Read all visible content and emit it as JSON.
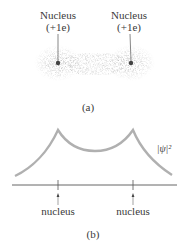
{
  "panel_a": {
    "nucleus_left": {
      "title": "Nucleus",
      "charge": "(+1e)"
    },
    "nucleus_right": {
      "title": "Nucleus",
      "charge": "(+1e)"
    },
    "caption": "(a)"
  },
  "panel_b": {
    "curve_label": "|ψ|²",
    "axis_labels": [
      "nucleus",
      "nucleus"
    ],
    "caption": "(b)"
  },
  "colors": {
    "curve": "#b0b0b0",
    "text": "#3a3a3a",
    "axis": "#555555",
    "cloud": "#9a9a9a",
    "nucleus_dot": "#444444"
  }
}
